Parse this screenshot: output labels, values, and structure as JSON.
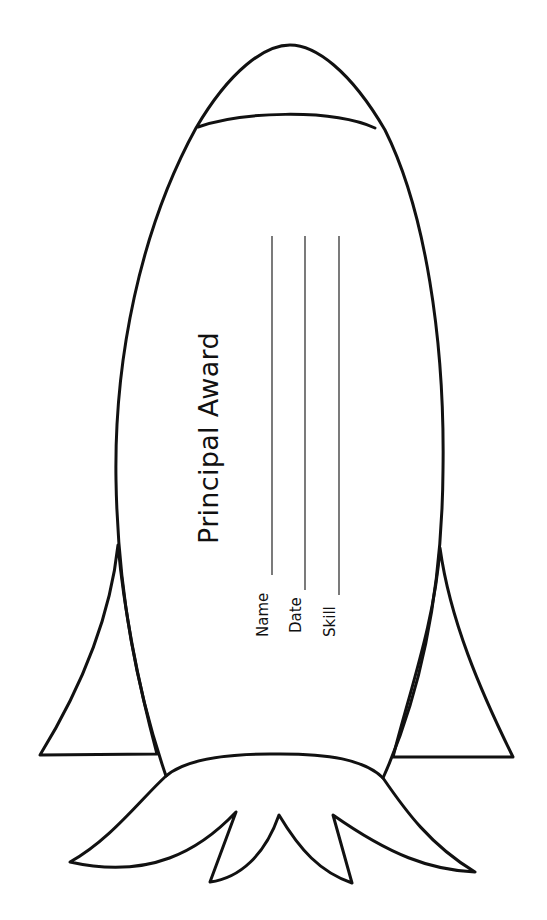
{
  "certificate": {
    "title": "Principal Award",
    "shape": "rocket",
    "fields": [
      {
        "label": "Name"
      },
      {
        "label": "Date"
      },
      {
        "label": "Skill"
      }
    ]
  },
  "colors": {
    "stroke": "#111111",
    "background": "#ffffff"
  }
}
